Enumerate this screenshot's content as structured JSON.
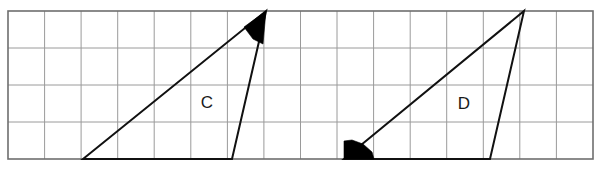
{
  "figure": {
    "canvas": {
      "width": 603,
      "height": 171
    },
    "background_color": "#ffffff"
  },
  "grid": {
    "line_color": "#9a9a9a",
    "border_color": "#6e6e6e",
    "line_width": 1,
    "border_width": 1.6,
    "origin_x": 8,
    "origin_y": 11,
    "cell_width": 36.56,
    "cell_height": 37,
    "columns": 16,
    "rows": 4,
    "x_lines": [
      8,
      44.6,
      81.1,
      117.7,
      154.2,
      190.8,
      227.4,
      263.9,
      300.5,
      337.0,
      373.6,
      410.2,
      446.7,
      483.3,
      519.8,
      556.4,
      593.0
    ],
    "y_lines": [
      11,
      48,
      85,
      122,
      159
    ]
  },
  "shapes": [
    {
      "id": "triangle-c",
      "label": "C",
      "label_x": 207,
      "label_y": 104,
      "stroke_color": "#111111",
      "stroke_width": 2.0,
      "fill": "none",
      "points": "83,159 266,11 232,159",
      "vertices": [
        {
          "name": "base-left",
          "x": 83,
          "y": 159
        },
        {
          "name": "apex",
          "x": 266,
          "y": 11
        },
        {
          "name": "base-right",
          "x": 232,
          "y": 159
        }
      ],
      "angle_marker": {
        "at_vertex": "apex",
        "fill_color": "#000000",
        "points": "266,11 244,27 253,39 263,44 266,11"
      }
    },
    {
      "id": "triangle-d",
      "label": "D",
      "label_x": 464,
      "label_y": 105,
      "stroke_color": "#111111",
      "stroke_width": 2.0,
      "fill": "none",
      "points": "344,159 524,11 490,159",
      "vertices": [
        {
          "name": "base-left",
          "x": 344,
          "y": 159
        },
        {
          "name": "apex",
          "x": 524,
          "y": 11
        },
        {
          "name": "base-right",
          "x": 490,
          "y": 159
        }
      ],
      "angle_marker": {
        "at_vertex": "base-left",
        "fill_color": "#000000",
        "points": "344,159 344,141 352,140 363,144 372,152 374,159 344,159"
      }
    }
  ],
  "labels": {
    "c": "C",
    "d": "D"
  }
}
